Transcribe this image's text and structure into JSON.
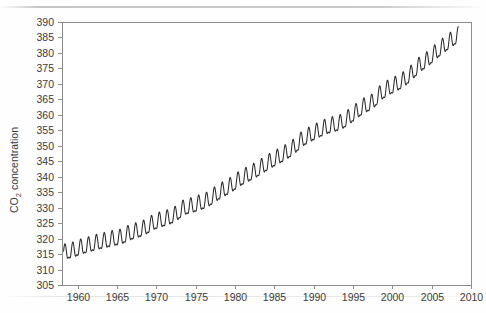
{
  "chart_data": {
    "type": "line",
    "title": "",
    "xlabel": "",
    "ylabel": "CO2 concentration",
    "ylabel_base": "CO",
    "ylabel_sub": "2",
    "ylabel_rest": " concentration",
    "xlim": [
      1958.0,
      2010.0
    ],
    "ylim": [
      305,
      390
    ],
    "grid": false,
    "legend": null,
    "xticks": [
      1960,
      1965,
      1970,
      1975,
      1980,
      1985,
      1990,
      1995,
      2000,
      2005,
      2010
    ],
    "xtick_labels": [
      "1960",
      "1965",
      "1970",
      "1975",
      "1980",
      "1985",
      "1990",
      "1995",
      "2000",
      "2005",
      "2010"
    ],
    "yticks": [
      305,
      310,
      315,
      320,
      325,
      330,
      335,
      340,
      345,
      350,
      355,
      360,
      365,
      370,
      375,
      380,
      385,
      390
    ],
    "ytick_labels": [
      "305",
      "310",
      "315",
      "320",
      "325",
      "330",
      "335",
      "340",
      "345",
      "350",
      "355",
      "360",
      "365",
      "370",
      "375",
      "380",
      "385",
      "390"
    ],
    "line_color": "#2b2b2b",
    "frame_color": "#8c8c8c",
    "background_color": "#ffffff",
    "series": [
      {
        "name": "Mauna Loa monthly mean CO2",
        "x_start": 1958.2,
        "x_end": 2008.4,
        "description": "Monthly mean atmospheric CO2 concentration (Keeling curve): rising trend with annual sawtooth oscillation, seasonal peak in May and trough in late September.",
        "annual_trend": [
          {
            "year": 1958,
            "value": 315.3
          },
          {
            "year": 1959,
            "value": 315.9
          },
          {
            "year": 1960,
            "value": 316.9
          },
          {
            "year": 1961,
            "value": 317.6
          },
          {
            "year": 1962,
            "value": 318.4
          },
          {
            "year": 1963,
            "value": 318.9
          },
          {
            "year": 1964,
            "value": 319.6
          },
          {
            "year": 1965,
            "value": 320.0
          },
          {
            "year": 1966,
            "value": 321.3
          },
          {
            "year": 1967,
            "value": 322.1
          },
          {
            "year": 1968,
            "value": 323.0
          },
          {
            "year": 1969,
            "value": 324.6
          },
          {
            "year": 1970,
            "value": 325.6
          },
          {
            "year": 1971,
            "value": 326.3
          },
          {
            "year": 1972,
            "value": 327.5
          },
          {
            "year": 1973,
            "value": 329.6
          },
          {
            "year": 1974,
            "value": 330.2
          },
          {
            "year": 1975,
            "value": 331.1
          },
          {
            "year": 1976,
            "value": 332.0
          },
          {
            "year": 1977,
            "value": 333.8
          },
          {
            "year": 1978,
            "value": 335.4
          },
          {
            "year": 1979,
            "value": 336.8
          },
          {
            "year": 1980,
            "value": 338.7
          },
          {
            "year": 1981,
            "value": 340.1
          },
          {
            "year": 1982,
            "value": 341.4
          },
          {
            "year": 1983,
            "value": 343.0
          },
          {
            "year": 1984,
            "value": 344.6
          },
          {
            "year": 1985,
            "value": 346.0
          },
          {
            "year": 1986,
            "value": 347.4
          },
          {
            "year": 1987,
            "value": 349.2
          },
          {
            "year": 1988,
            "value": 351.6
          },
          {
            "year": 1989,
            "value": 353.1
          },
          {
            "year": 1990,
            "value": 354.4
          },
          {
            "year": 1991,
            "value": 355.6
          },
          {
            "year": 1992,
            "value": 356.4
          },
          {
            "year": 1993,
            "value": 357.1
          },
          {
            "year": 1994,
            "value": 358.8
          },
          {
            "year": 1995,
            "value": 360.8
          },
          {
            "year": 1996,
            "value": 362.6
          },
          {
            "year": 1997,
            "value": 363.7
          },
          {
            "year": 1998,
            "value": 366.6
          },
          {
            "year": 1999,
            "value": 368.3
          },
          {
            "year": 2000,
            "value": 369.5
          },
          {
            "year": 2001,
            "value": 371.0
          },
          {
            "year": 2002,
            "value": 373.2
          },
          {
            "year": 2003,
            "value": 375.8
          },
          {
            "year": 2004,
            "value": 377.5
          },
          {
            "year": 2005,
            "value": 379.8
          },
          {
            "year": 2006,
            "value": 381.9
          },
          {
            "year": 2007,
            "value": 383.8
          },
          {
            "year": 2008,
            "value": 385.6
          }
        ],
        "seasonal_amplitude_ppm": 6.2,
        "seasonal_peak_month": 5,
        "seasonal_trough_month": 9.5,
        "y_min_observed": 312.9,
        "y_max_observed": 389.6
      }
    ]
  },
  "geometry": {
    "plot_left": 62,
    "plot_right": 471,
    "plot_top": 22,
    "plot_bottom": 285
  }
}
